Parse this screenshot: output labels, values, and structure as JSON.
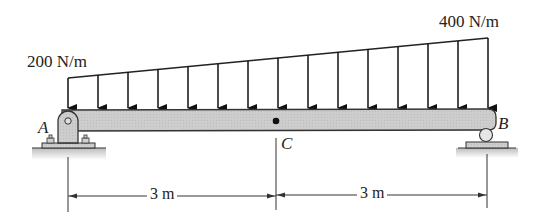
{
  "diagram": {
    "type": "beam-loading",
    "beam": {
      "color": "#c8c8c8",
      "outline": "#333333",
      "span_m": 6
    },
    "load": {
      "type": "linearly-varying distributed load",
      "left_intensity_label": "200 N/m",
      "right_intensity_label": "400 N/m",
      "arrow_count": 15
    },
    "points": {
      "A": {
        "label": "A",
        "support": "pin"
      },
      "B": {
        "label": "B",
        "support": "roller"
      },
      "C": {
        "label": "C",
        "note": "midspan point"
      }
    },
    "dimensions": [
      {
        "from": "A",
        "to": "C",
        "label": "3 m"
      },
      {
        "from": "C",
        "to": "B",
        "label": "3 m"
      }
    ]
  }
}
